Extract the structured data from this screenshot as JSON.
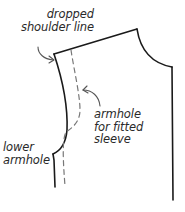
{
  "diagram": {
    "colors": {
      "outline": "#1a1a1a",
      "dashed": "#777777",
      "arrow": "#555555",
      "text": "#2a2a2a",
      "background": "#ffffff"
    },
    "labels": {
      "dropped_shoulder": {
        "line1": "dropped",
        "line2": "shoulder line"
      },
      "fitted_armhole": {
        "line1": "armhole",
        "line2": "for fitted",
        "line3": "sleeve"
      },
      "lower_armhole": {
        "line1": "lower",
        "line2": "armhole"
      }
    },
    "elements": [
      "shoulder-line",
      "neckline",
      "center-front",
      "dropped-shoulder-armhole",
      "lower-armhole",
      "fitted-armhole-dashed",
      "arrow-dropped-shoulder",
      "arrow-fitted-armhole"
    ]
  }
}
